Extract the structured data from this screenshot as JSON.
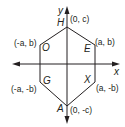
{
  "diagram": {
    "type": "coordinate-plane-hexagon",
    "axes": {
      "x_label": "x",
      "y_label": "y"
    },
    "colors": {
      "axis": "#231f20",
      "polygon": "#231f20",
      "text": "#231f20"
    },
    "vertices": [
      {
        "name": "H",
        "coords": "(0, c)"
      },
      {
        "name": "E",
        "coords": "(a, b)"
      },
      {
        "name": "X",
        "coords": "(a, -b)"
      },
      {
        "name": "A",
        "coords": "(0, -c)"
      },
      {
        "name": "G",
        "coords": "(-a, -b)"
      },
      {
        "name": "O",
        "coords": "(-a, b)"
      }
    ]
  }
}
